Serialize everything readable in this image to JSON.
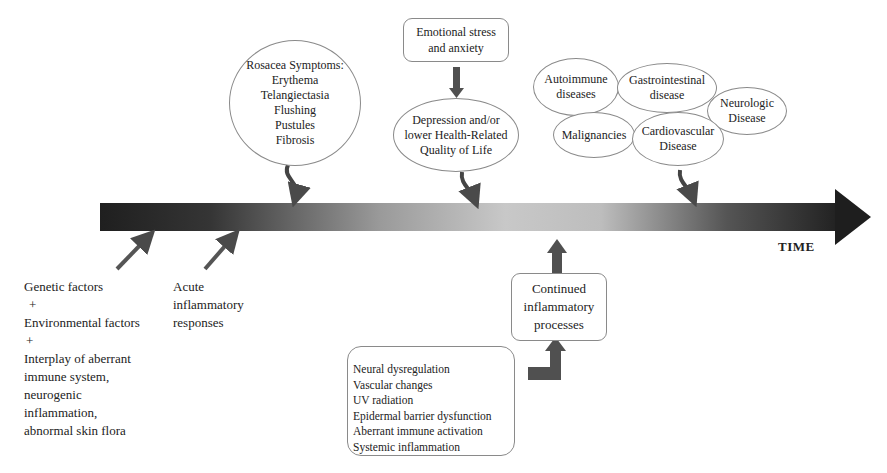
{
  "timeline": {
    "axis_label": "TIME"
  },
  "rosacea_symptoms": {
    "lines": [
      "Rosacea Symptoms:",
      "Erythema",
      "Telangiectasia",
      "Flushing",
      "Pustules",
      "Fibrosis"
    ]
  },
  "emotional_stress": {
    "lines": [
      "Emotional stress",
      "and anxiety"
    ]
  },
  "depression": {
    "lines": [
      "Depression and/or",
      "lower Health-Related",
      "Quality of Life"
    ]
  },
  "comorbidities": {
    "autoimmune": [
      "Autoimmune",
      "diseases"
    ],
    "gastrointestinal": [
      "Gastrointestinal",
      "disease"
    ],
    "neurologic": [
      "Neurologic",
      "Disease"
    ],
    "malignancies": [
      "Malignancies"
    ],
    "cardiovascular": [
      "Cardiovascular",
      "Disease"
    ]
  },
  "causes": {
    "lines": [
      "Genetic factors",
      "+",
      "Environmental factors",
      "+",
      "Interplay of aberrant",
      "immune system,",
      "neurogenic",
      "inflammation,",
      "abnormal skin flora"
    ]
  },
  "acute": {
    "lines": [
      "Acute",
      "inflammatory",
      "responses"
    ]
  },
  "continued": {
    "lines": [
      "Continued",
      "inflammatory",
      "processes"
    ]
  },
  "mechanisms": {
    "lines": [
      "Neural dysregulation",
      "Vascular changes",
      "UV radiation",
      "Epidermal barrier dysfunction",
      "Aberrant immune activation",
      "Systemic inflammation"
    ]
  },
  "colors": {
    "arrow": "#555555",
    "timeline_dark": "#1e1e1e",
    "timeline_light": "#c8c8c8",
    "outline": "#8a8a8a"
  }
}
